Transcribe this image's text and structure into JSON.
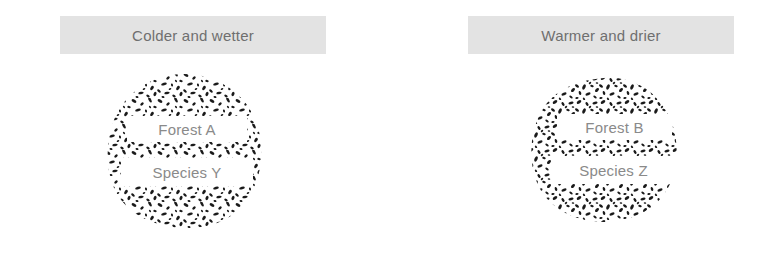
{
  "figure": {
    "background_color": "#ffffff",
    "banner_color": "#e3e3e3",
    "banner_text_color": "#6f6f6f",
    "plate_text_color": "#8a8a8a",
    "texture_color": "#1a1a1a"
  },
  "scenarios": [
    {
      "id": "colder-wetter",
      "banner_label": "Colder and wetter",
      "forest_label": "Forest A",
      "species_label": "Species Y"
    },
    {
      "id": "warmer-drier",
      "banner_label": "Warmer and drier",
      "forest_label": "Forest B",
      "species_label": "Species Z"
    }
  ]
}
